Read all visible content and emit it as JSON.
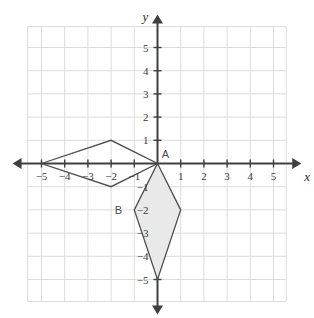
{
  "chart_data": {
    "type": "scatter",
    "title": "",
    "xlabel": "x",
    "ylabel": "y",
    "xlim": [
      -5.6,
      5.6
    ],
    "ylim": [
      -5.9,
      5.9
    ],
    "grid": true,
    "grid_step": 1,
    "legend": "none",
    "x_ticks": [
      "-5",
      "-4",
      "-3",
      "-2",
      "-1",
      "1",
      "2",
      "3",
      "4",
      "5"
    ],
    "x_tick_values": [
      -5,
      -4,
      -3,
      -2,
      -1,
      1,
      2,
      3,
      4,
      5
    ],
    "y_ticks": [
      "5",
      "4",
      "3",
      "2",
      "1",
      "-1",
      "-2",
      "-3",
      "-4",
      "-5"
    ],
    "y_tick_values": [
      5,
      4,
      3,
      2,
      1,
      -1,
      -2,
      -3,
      -4,
      -5
    ],
    "axis_origin_label": "",
    "shapes": [
      {
        "name": "preimage-kite",
        "kind": "polygon",
        "filled": false,
        "fill": "#ffffff",
        "stroke": "#4d4d4d",
        "points": [
          [
            -5,
            0
          ],
          [
            -2,
            1
          ],
          [
            0,
            0
          ],
          [
            -2,
            -1
          ]
        ],
        "labels": []
      },
      {
        "name": "image-kite",
        "kind": "polygon",
        "filled": true,
        "fill": "#e9e9e9",
        "stroke": "#4d4d4d",
        "points": [
          [
            0,
            0
          ],
          [
            1,
            -2
          ],
          [
            0,
            -5
          ],
          [
            -1,
            -2
          ]
        ],
        "labels": [
          "A",
          "B"
        ]
      }
    ],
    "point_labels": [
      {
        "text": "A",
        "x": 0,
        "y": 0,
        "dx": 8,
        "dy": -6
      },
      {
        "text": "B",
        "x": -1,
        "y": -2,
        "dx": -16,
        "dy": 4
      }
    ]
  },
  "colors": {
    "grid": "#dcdcdc",
    "axis": "#3f3f3f",
    "stroke": "#4d4d4d",
    "fill": "#e9e9e9",
    "text": "#3a3a3a",
    "background": "#ffffff"
  },
  "figure": {
    "width": 314,
    "height": 318
  }
}
